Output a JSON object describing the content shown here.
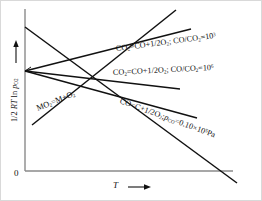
{
  "figure": {
    "background_color": "#ffffff",
    "line_color": "#111111",
    "axis_color": "#8a8a8a"
  },
  "axes": {
    "y_label_html": "1/2 <i>RT</i> ln <i>p</i><sub>O2</sub>",
    "y_label_text": "1/2 RT ln p_O2",
    "x_label_html": "<i>T</i>",
    "x_label_text": "T",
    "x_arrow": "→",
    "y_arrow": "↑",
    "origin_label": "0"
  },
  "chart_data": {
    "type": "line",
    "title": "",
    "xlabel": "T",
    "ylabel": "1/2 RT ln p_O2",
    "xlim": [
      0,
      1
    ],
    "ylim": [
      0,
      1
    ],
    "grid": false,
    "legend": "inline-annotations",
    "series": [
      {
        "name": "CO2=CO+1/2O2; CO/CO2=10^3",
        "label_html": "CO<sub>2</sub>=CO+1/2O<sub>2</sub>; CO/CO<sub>2</sub>=10<sup>3</sup>",
        "label_text": "CO2=CO+1/2O2; CO/CO2=10^3",
        "slope": "rising",
        "x": [
          0.0,
          1.0
        ],
        "y": [
          0.6,
          0.93
        ]
      },
      {
        "name": "CO2=CO+1/2O2; CO/CO2=10^6",
        "label_html": "CO<sub>2</sub>=CO+1/2O<sub>2</sub>; CO/CO<sub>2</sub>=10<sup>6</sup>",
        "label_text": "CO2=CO+1/2O2; CO/CO2=10^6",
        "slope": "slightly-falling",
        "x": [
          0.0,
          1.0
        ],
        "y": [
          0.6,
          0.46
        ]
      },
      {
        "name": "CO=C+1/2O2; p_CO=0.10x10^5 Pa",
        "label_html": "CO=C+1/2O<sub>2</sub>;<i>p</i><sub>CO</sub>=0.10×10<sup>5</sup>Pa",
        "label_text": "CO=C+1/2O2; p_CO=0.10x10^5 Pa",
        "slope": "falling",
        "x": [
          0.0,
          1.0
        ],
        "y": [
          0.87,
          0.1
        ]
      },
      {
        "name": "MO2=M+O2",
        "label_html": "MO<sub>2</sub>=M+O<sub>2</sub>",
        "label_text": "MO2=M+O2",
        "slope": "steeply-rising",
        "x": [
          0.08,
          0.72
        ],
        "y": [
          0.16,
          1.0
        ]
      },
      {
        "name": "unlabeled-descending-line",
        "label_html": "",
        "label_text": "",
        "slope": "falling",
        "x": [
          0.0,
          1.0
        ],
        "y": [
          0.6,
          0.36
        ]
      }
    ]
  }
}
